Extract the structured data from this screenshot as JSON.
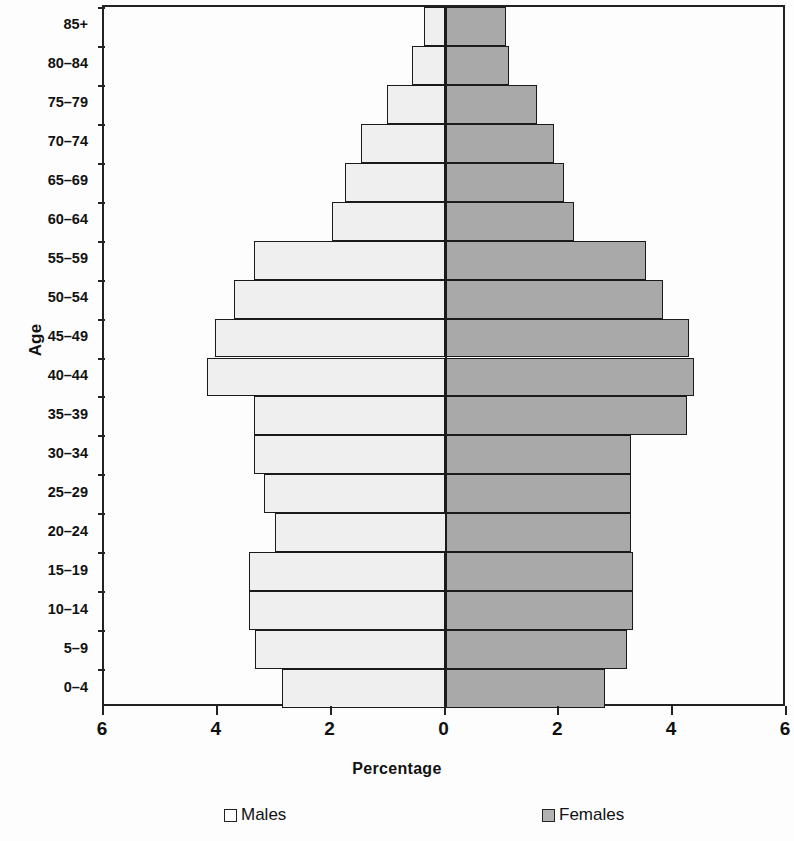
{
  "chart_data": {
    "type": "bar",
    "title": "",
    "subtitle": "",
    "xlabel": "Percentage",
    "ylabel": "Age",
    "orientation": "horizontal",
    "style": "population-pyramid",
    "grid": false,
    "legend_position": "bottom",
    "xlim": [
      -6,
      6
    ],
    "x_tick_labels": [
      "6",
      "4",
      "2",
      "0",
      "2",
      "4",
      "6"
    ],
    "x_tick_values": [
      -6,
      -4,
      -2,
      0,
      2,
      4,
      6
    ],
    "categories": [
      "0–4",
      "5–9",
      "10–14",
      "15–19",
      "20–24",
      "25–29",
      "30–34",
      "35–39",
      "40–44",
      "45–49",
      "50–54",
      "55–59",
      "60–64",
      "65–69",
      "70–74",
      "75–79",
      "80–84",
      "85+"
    ],
    "series": [
      {
        "name": "Males",
        "color": "#efefef",
        "side": "left",
        "values": [
          2.88,
          3.34,
          3.46,
          3.45,
          3.0,
          3.19,
          3.37,
          3.37,
          4.19,
          4.05,
          3.72,
          3.37,
          1.99,
          1.76,
          1.48,
          1.03,
          0.58,
          0.37
        ]
      },
      {
        "name": "Females",
        "color": "#a9a9a9",
        "side": "right",
        "values": [
          2.81,
          3.19,
          3.3,
          3.3,
          3.26,
          3.26,
          3.26,
          4.24,
          4.36,
          4.27,
          3.82,
          3.52,
          2.25,
          2.08,
          1.9,
          1.6,
          1.12,
          1.06
        ]
      }
    ]
  },
  "legend": {
    "males_label": "Males",
    "females_label": "Females"
  },
  "axes": {
    "y_title": "Age",
    "x_title": "Percentage"
  }
}
